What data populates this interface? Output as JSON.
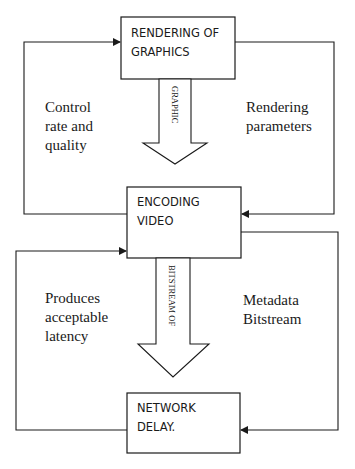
{
  "diagram": {
    "title": "",
    "nodes": [
      {
        "id": "rendering",
        "lines": [
          "RENDERING OF",
          "GRAPHICS"
        ]
      },
      {
        "id": "encoding",
        "lines": [
          "ENCODING",
          "VIDEO"
        ]
      },
      {
        "id": "network",
        "lines": [
          "NETWORK",
          "DELAY."
        ]
      }
    ],
    "flow_arrows": [
      {
        "from": "rendering",
        "to": "encoding",
        "label": "GRAPHIC"
      },
      {
        "from": "encoding",
        "to": "network",
        "label": "BITSTREAM OF"
      }
    ],
    "feedback_edges": [
      {
        "from": "encoding",
        "to": "rendering",
        "side": "left",
        "lines": [
          "Control",
          "rate and",
          "quality"
        ]
      },
      {
        "from": "rendering",
        "to": "encoding",
        "side": "right",
        "lines": [
          "Rendering",
          "parameters"
        ]
      },
      {
        "from": "network",
        "to": "encoding",
        "side": "left",
        "lines": [
          "Produces",
          "acceptable",
          "latency"
        ]
      },
      {
        "from": "encoding",
        "to": "network",
        "side": "right",
        "lines": [
          "Metadata",
          "Bitstream"
        ]
      }
    ],
    "colors": {
      "stroke": "#1a1a1a",
      "background": "#ffffff"
    }
  }
}
